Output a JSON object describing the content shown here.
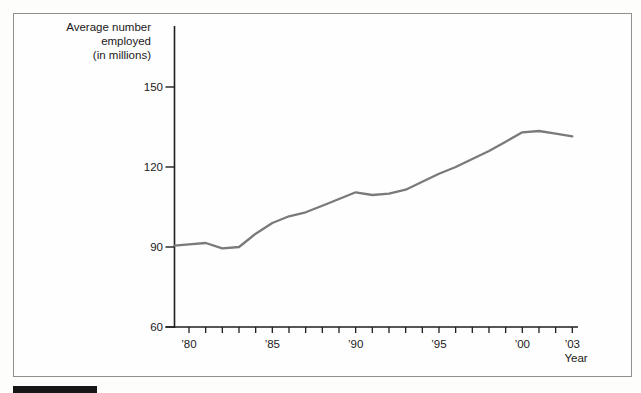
{
  "figure": {
    "y_axis_title_lines": [
      "Average number",
      "employed",
      "(in millions)"
    ],
    "x_axis_title": "Year"
  },
  "chart_data": {
    "type": "line",
    "title": "",
    "ylabel": "Average number employed (in millions)",
    "xlabel": "Year",
    "x": [
      1979,
      1980,
      1981,
      1982,
      1983,
      1984,
      1985,
      1986,
      1987,
      1988,
      1989,
      1990,
      1991,
      1992,
      1993,
      1994,
      1995,
      1996,
      1997,
      1998,
      1999,
      2000,
      2001,
      2002,
      2003
    ],
    "series": [
      {
        "name": "Average number employed (millions)",
        "values": [
          90.5,
          91,
          91.5,
          89.5,
          90,
          95,
          99,
          101.5,
          103,
          105.5,
          108,
          110.5,
          109.5,
          110,
          111.5,
          114.5,
          117.5,
          120,
          123,
          126,
          129.5,
          133,
          133.5,
          132.5,
          131.5
        ]
      }
    ],
    "ylim": [
      60,
      150
    ],
    "xlim": [
      1979,
      2003
    ],
    "y_ticks": [
      60,
      90,
      120,
      150
    ],
    "y_tick_labels": [
      "60",
      "90",
      "120",
      "150"
    ],
    "x_labeled_ticks": [
      {
        "year": 1980,
        "label": "’80"
      },
      {
        "year": 1985,
        "label": "’85"
      },
      {
        "year": 1990,
        "label": "’90"
      },
      {
        "year": 1995,
        "label": "’95"
      },
      {
        "year": 2000,
        "label": "’00"
      },
      {
        "year": 2003,
        "label": "’03"
      }
    ],
    "x_minor_tick_interval_years": 1,
    "grid": false,
    "legend": "none",
    "line_color": "#7a7a7a",
    "axis_color": "#1f1f1f"
  }
}
